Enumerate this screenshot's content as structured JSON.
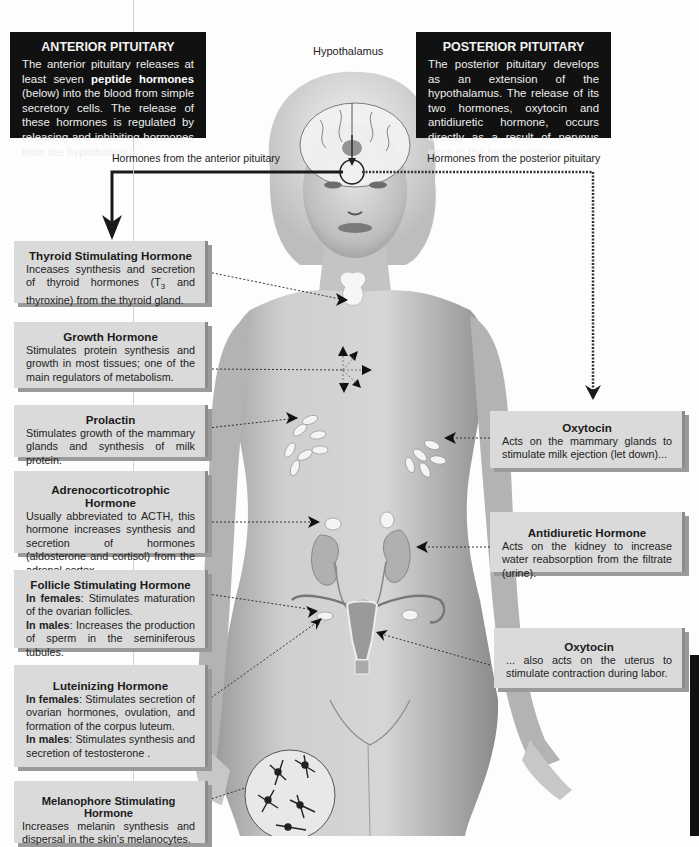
{
  "anterior": {
    "title": "ANTERIOR PITUITARY",
    "body_pre": "The anterior pituitary releases at least seven ",
    "body_bold": "peptide hormones",
    "body_post": " (below) into the blood from simple secretory cells. The release of these hormones is regulated by releasing and inhibiting hormones from the hypothalamus."
  },
  "posterior": {
    "title": "POSTERIOR PITUITARY",
    "body": "The posterior pituitary develops as an extension of the hypothalamus. The release of its two hormones, oxytocin and antidiuretic hormone, occurs directly as a result of nervous input to the hypothalamus."
  },
  "labels": {
    "hypothalamus": "Hypothalamus",
    "anterior_path": "Hormones from the anterior pituitary",
    "posterior_path": "Hormones from the posterior pituitary"
  },
  "left_cards": [
    {
      "title": "Thyroid Stimulating Hormone",
      "body_pre": "Inceases synthesis and secretion of thyroid hormones (T",
      "sub": "3",
      "body_post": " and thyroxine) from the thyroid gland."
    },
    {
      "title": "Growth Hormone",
      "body": "Stimulates protein synthesis and growth in most tissues; one of the main regulators of metabolism."
    },
    {
      "title": "Prolactin",
      "body": "Stimulates growth of the mammary glands and synthesis of milk protein."
    },
    {
      "title": "Adrenocorticotrophic Hormone",
      "body": "Usually abbreviated to ACTH, this hormone increases synthesis and secretion of hormones (aldosterone and cortisol) from the adrenal cortex."
    },
    {
      "title": "Follicle Stimulating Hormone",
      "f_label": "In females",
      "f_text": ": Stimulates maturation of the ovarian follicles.",
      "m_label": "In males",
      "m_text": ": Increases the production of sperm in the seminiferous tubules."
    },
    {
      "title": "Luteinizing Hormone",
      "f_label": "In females",
      "f_text": ": Stimulates secretion of ovarian hormones, ovulation, and formation of the corpus luteum.",
      "m_label": "In males",
      "m_text": ": Stimulates synthesis and secretion of testosterone ."
    },
    {
      "title": "Melanophore Stimulating Hormone",
      "body": "Increases melanin synthesis and dispersal in the skin's melanocytes."
    }
  ],
  "right_cards": [
    {
      "title": "Oxytocin",
      "body": "Acts on the mammary glands to stimulate milk ejection (let down)..."
    },
    {
      "title": "Antidiuretic Hormone",
      "body": "Acts on the kidney to increase water reabsorption from the filtrate (urine)."
    },
    {
      "title": "Oxytocin",
      "body": "... also acts on the uterus to stimulate contraction during labor."
    }
  ],
  "colors": {
    "dark_box": "#111111",
    "card_bg": "#dadada",
    "card_shadow": "#9a9a9a",
    "skin": "#c8c8c8",
    "arrow": "#1a1a1a"
  }
}
